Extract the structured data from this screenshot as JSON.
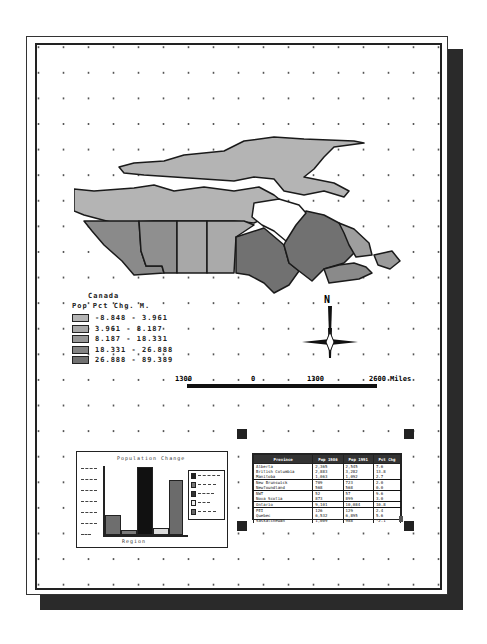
{
  "layout": {
    "map_title": "Canada",
    "legend": {
      "title": "Canada",
      "subtitle": "Pop Pct Chg. M.",
      "classes": [
        {
          "range": "-8.848 - 3.961",
          "color": "#b4b4b4"
        },
        {
          "range": "3.961 - 8.187",
          "color": "#a8a8a8"
        },
        {
          "range": "8.187 - 18.331",
          "color": "#969696"
        },
        {
          "range": "18.331 - 26.888",
          "color": "#838383"
        },
        {
          "range": "26.888 - 89.389",
          "color": "#717171"
        }
      ]
    },
    "north_arrow": {
      "label": "N"
    },
    "scale_bar": {
      "labels": [
        "1300",
        "0",
        "1300",
        "2600 Miles"
      ]
    },
    "chart": {
      "title": "Population Change",
      "xlabel": "Region",
      "bars": [
        {
          "name": "West",
          "value": 28,
          "color": "#6e6e6e"
        },
        {
          "name": "Prairies",
          "value": 6,
          "color": "#7a7a7a"
        },
        {
          "name": "Ontario",
          "value": 100,
          "color": "#111111"
        },
        {
          "name": "Quebec",
          "value": 9,
          "color": "#dcdcdc"
        },
        {
          "name": "Atlantic",
          "value": 81,
          "color": "#6b6b6b"
        }
      ],
      "legend_colors": [
        "#222222",
        "#777777",
        "#333333",
        "#eeeeee",
        "#666666"
      ]
    },
    "table": {
      "headers": [
        "Province",
        "Pop 1986",
        "Pop 1991",
        "Pct Chg"
      ],
      "rows": [
        [
          "Alberta",
          "2,365",
          "2,545",
          "7.6"
        ],
        [
          "British Columbia",
          "2,883",
          "3,282",
          "13.8"
        ],
        [
          "Manitoba",
          "1,063",
          "1,092",
          "2.7"
        ],
        [
          "New Brunswick",
          "709",
          "723",
          "2.0"
        ],
        [
          "Newfoundland",
          "568",
          "568",
          "0.0"
        ],
        [
          "NWT",
          "52",
          "57",
          "9.6"
        ],
        [
          "Nova Scotia",
          "873",
          "899",
          "3.0"
        ],
        [
          "Ontario",
          "9,101",
          "10,084",
          "10.8"
        ],
        [
          "PEI",
          "126",
          "129",
          "2.4"
        ],
        [
          "Quebec",
          "6,532",
          "6,895",
          "5.6"
        ],
        [
          "Saskatchewan",
          "1,009",
          "988",
          "-2.1"
        ]
      ]
    }
  },
  "colors": {
    "shadow": "#2a2a2a",
    "frame": "#222222",
    "grid_dot": "#555555"
  }
}
